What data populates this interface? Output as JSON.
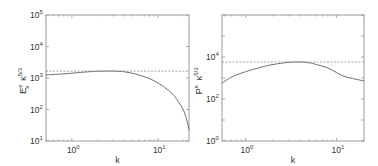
{
  "chart_data": [
    {
      "type": "line",
      "title": "",
      "xlabel": "k",
      "ylabel": "E_κ^κ κ^{5/3}",
      "xscale": "log",
      "yscale": "log",
      "xlim": [
        0.5,
        23
      ],
      "ylim": [
        10,
        100000
      ],
      "x_ticks": [
        {
          "value": 1,
          "label": "10^0"
        },
        {
          "value": 10,
          "label": "10^1"
        }
      ],
      "y_ticks": [
        {
          "value": 10,
          "label": "10^1"
        },
        {
          "value": 100,
          "label": "10^2"
        },
        {
          "value": 1000,
          "label": "10^3"
        },
        {
          "value": 10000,
          "label": "10^4"
        },
        {
          "value": 100000,
          "label": "10^5"
        }
      ],
      "grid": false,
      "legend": null,
      "series": [
        {
          "name": "spectrum",
          "style": "solid",
          "x": [
            0.5,
            0.7,
            1.0,
            1.5,
            2.0,
            3.0,
            4.0,
            5.0,
            6.0,
            8.0,
            10.0,
            12.0,
            15.0,
            18.0,
            20.0,
            22.0,
            23.0
          ],
          "y": [
            1260,
            1320,
            1420,
            1560,
            1640,
            1660,
            1580,
            1420,
            1250,
            950,
            700,
            500,
            300,
            150,
            90,
            40,
            22
          ]
        },
        {
          "name": "reference",
          "style": "dashed",
          "x": [
            0.5,
            23
          ],
          "y": [
            1660,
            1660
          ]
        }
      ]
    },
    {
      "type": "line",
      "title": "",
      "xlabel": "k",
      "ylabel": "P^κ κ^{5/3}",
      "xscale": "log",
      "yscale": "log",
      "xlim": [
        0.55,
        20
      ],
      "ylim": [
        1,
        1000000
      ],
      "x_ticks": [
        {
          "value": 1,
          "label": "10^0"
        },
        {
          "value": 10,
          "label": "10^1"
        }
      ],
      "y_ticks": [
        {
          "value": 1,
          "label": "10^0"
        },
        {
          "value": 100,
          "label": "10^2"
        },
        {
          "value": 10000,
          "label": "10^4"
        }
      ],
      "grid": false,
      "legend": null,
      "series": [
        {
          "name": "spectrum",
          "style": "solid",
          "x": [
            0.55,
            0.7,
            1.0,
            1.5,
            2.0,
            3.0,
            4.0,
            5.0,
            6.0,
            8.0,
            10.0,
            12.0,
            15.0,
            20.0
          ],
          "y": [
            575,
            1100,
            2000,
            3300,
            4400,
            5600,
            5750,
            5300,
            4400,
            3000,
            1800,
            1200,
            950,
            720
          ]
        },
        {
          "name": "reference",
          "style": "dashed",
          "x": [
            0.55,
            20
          ],
          "y": [
            5750,
            5750
          ]
        }
      ]
    }
  ],
  "left": {
    "xlabel": "k",
    "ylabel_main": "E",
    "ylabel_sub": "κ",
    "ylabel_sup": "κ",
    "ylabel_k": "κ",
    "ylabel_exp": "5/3",
    "xticks": [
      {
        "base": "10",
        "exp": "0"
      },
      {
        "base": "10",
        "exp": "1"
      }
    ],
    "yticks": [
      {
        "base": "10",
        "exp": "1"
      },
      {
        "base": "10",
        "exp": "2"
      },
      {
        "base": "10",
        "exp": "3"
      },
      {
        "base": "10",
        "exp": "4"
      },
      {
        "base": "10",
        "exp": "5"
      }
    ]
  },
  "right": {
    "xlabel": "k",
    "ylabel_main": "P",
    "ylabel_sup": "κ",
    "ylabel_k": "κ",
    "ylabel_exp": "5/3",
    "xticks": [
      {
        "base": "10",
        "exp": "0"
      },
      {
        "base": "10",
        "exp": "1"
      }
    ],
    "yticks": [
      {
        "base": "10",
        "exp": "0"
      },
      {
        "base": "10",
        "exp": "2"
      },
      {
        "base": "10",
        "exp": "4"
      }
    ]
  }
}
